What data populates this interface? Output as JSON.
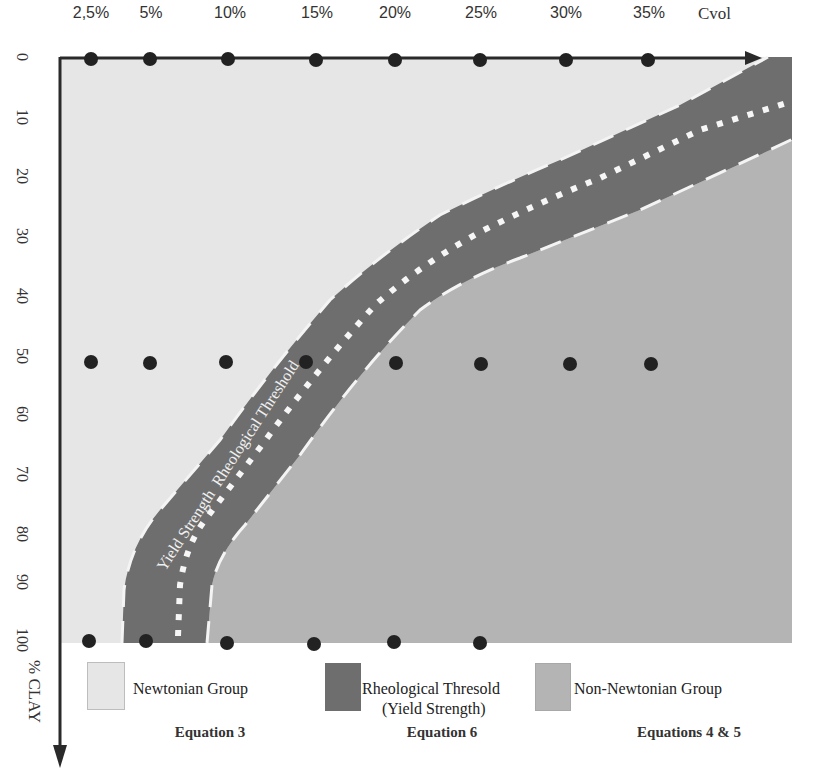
{
  "x_axis": {
    "title": "Cvol",
    "ticks": [
      "2,5%",
      "5%",
      "10%",
      "15%",
      "20%",
      "25%",
      "30%",
      "35%"
    ]
  },
  "y_axis": {
    "title": "% CLAY",
    "ticks": [
      "0",
      "10",
      "20",
      "30",
      "40",
      "50",
      "60",
      "70",
      "80",
      "90",
      "100"
    ]
  },
  "band_label": "Yield Strength  Rheological Threshold",
  "legend": [
    {
      "label": "Newtonian Group",
      "equation": "Equation 3",
      "color": "#e6e6e6"
    },
    {
      "label": "Rheological Thresold",
      "label_line2": "(Yield Strength)",
      "equation": "Equation 6",
      "color": "#6e6e6e"
    },
    {
      "label": "Non-Newtonian Group",
      "equation": "Equations 4 & 5",
      "color": "#b4b4b4"
    }
  ],
  "colors": {
    "newtonian": "#e6e6e6",
    "threshold_band": "#6e6e6e",
    "non_newtonian": "#b4b4b4",
    "axis": "#2a2a2a",
    "sample_point": "#222222"
  },
  "sample_points": {
    "row_0": {
      "clay": 0,
      "cvol": [
        "2,5%",
        "5%",
        "10%",
        "15%",
        "20%",
        "25%",
        "30%",
        "35%"
      ]
    },
    "row_50": {
      "clay": 50,
      "cvol": [
        "2,5%",
        "5%",
        "10%",
        "15%",
        "20%",
        "25%",
        "30%",
        "35%"
      ]
    },
    "row_100": {
      "clay": 100,
      "cvol": [
        "2,5%",
        "5%",
        "10%",
        "15%",
        "20%",
        "25%"
      ]
    }
  }
}
